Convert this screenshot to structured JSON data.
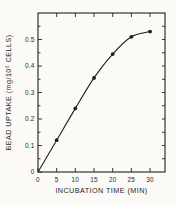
{
  "figure": {
    "background": "#fbfaf7",
    "ink": "#1f1f1f"
  },
  "chart_data": {
    "type": "line",
    "title": "",
    "xlabel": "INCUBATION TIME (MIN)",
    "ylabel": "BEAD UPTAKE (mg/10⁶ CELLS)",
    "x": [
      0,
      5,
      10,
      15,
      20,
      25,
      30
    ],
    "y": [
      0,
      0.12,
      0.24,
      0.355,
      0.445,
      0.51,
      0.53
    ],
    "xlim": [
      0,
      34
    ],
    "ylim": [
      0,
      0.6
    ],
    "x_ticks": [
      0,
      5,
      10,
      15,
      20,
      25,
      30
    ],
    "x_tick_labels": [
      "0",
      "5",
      "10",
      "15",
      "20",
      "25",
      "30"
    ],
    "y_ticks": [
      0,
      0.1,
      0.2,
      0.3,
      0.4,
      0.5
    ],
    "y_tick_labels": [
      "0",
      "0.1",
      "0.2",
      "0.3",
      "0.4",
      "0.5"
    ],
    "y_minor_step": 0.05,
    "grid": false,
    "frame": "box-with-inward-ticks",
    "marker": "filled-circle",
    "line_color": "#1f1f1f"
  }
}
